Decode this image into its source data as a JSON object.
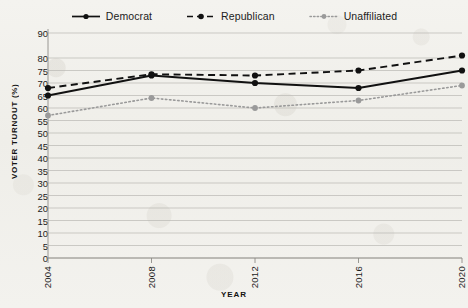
{
  "chart_data": {
    "type": "line",
    "title": "",
    "xlabel": "YEAR",
    "ylabel": "VOTER TURNOUT (%)",
    "x": [
      2004,
      2008,
      2012,
      2016,
      2020
    ],
    "categories": [
      "2004",
      "2008",
      "2012",
      "2016",
      "2020"
    ],
    "xtick_labels": [
      "2004",
      "2008",
      "2012",
      "2016",
      "2020"
    ],
    "ytick_labels": [
      "0",
      "5",
      "10",
      "15",
      "20",
      "25",
      "30",
      "35",
      "40",
      "45",
      "50",
      "55",
      "60",
      "65",
      "70",
      "75",
      "80",
      "90"
    ],
    "ytick_values": [
      0,
      5,
      10,
      15,
      20,
      25,
      30,
      35,
      40,
      45,
      50,
      55,
      60,
      65,
      70,
      75,
      80,
      90
    ],
    "ylim": [
      0,
      90
    ],
    "xlim": [
      2004,
      2020
    ],
    "grid": true,
    "legend_position": "top-center",
    "series": [
      {
        "name": "Democrat",
        "values": [
          65,
          73,
          70,
          68,
          75
        ],
        "color": "#111111",
        "linestyle": "solid",
        "marker": "circle"
      },
      {
        "name": "Republican",
        "values": [
          68,
          73.5,
          73,
          75,
          81
        ],
        "color": "#111111",
        "linestyle": "dashed",
        "marker": "circle"
      },
      {
        "name": "Unaffiliated",
        "values": [
          57,
          64,
          60,
          63,
          69
        ],
        "color": "#9a9a9a",
        "linestyle": "dotted",
        "marker": "circle"
      }
    ]
  },
  "legend": {
    "items": [
      {
        "label": "Democrat"
      },
      {
        "label": "Republican"
      },
      {
        "label": "Unaffiliated"
      }
    ]
  },
  "axes": {
    "y_title": "VOTER TURNOUT (%)",
    "x_title": "YEAR"
  },
  "colors": {
    "background": "#f2f1ed",
    "grid": "#b9b8b3",
    "axis": "#8e8d88",
    "dark_series": "#111111",
    "gray_series": "#9a9a9a",
    "text": "#1b1b1b"
  }
}
